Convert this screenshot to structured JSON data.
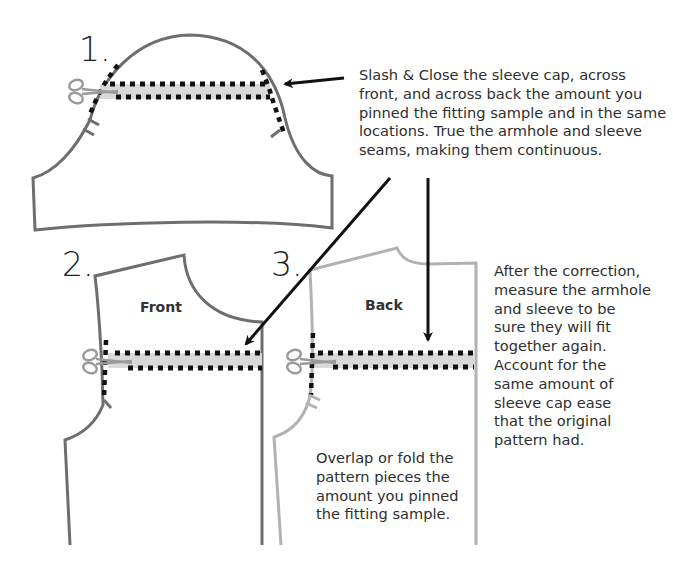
{
  "diagram": {
    "steps": [
      {
        "number": "1.",
        "piece": "sleeve"
      },
      {
        "number": "2.",
        "piece": "front bodice",
        "label": "Front"
      },
      {
        "number": "3.",
        "piece": "back bodice",
        "label": "Back"
      }
    ],
    "notes": {
      "slash_close": {
        "lines": [
          "Slash & Close the sleeve cap, across",
          "front, and across back the amount you",
          "pinned the fitting sample and in the same",
          "locations. True the armhole and sleeve",
          "seams, making them continuous."
        ]
      },
      "after_correction": {
        "lines": [
          "After the correction,",
          "measure the armhole",
          "and sleeve to be",
          "sure they will fit",
          "together again.",
          "Account for the",
          "same amount of",
          "sleeve cap ease",
          "that the original",
          "pattern had."
        ]
      },
      "overlap": {
        "lines": [
          "Overlap or fold the",
          "pattern pieces the",
          "amount you pinned",
          "the fitting sample."
        ]
      }
    },
    "icons": [
      "scissors-icon",
      "arrow-icon",
      "notch-mark-icon"
    ],
    "colors": {
      "front_outline": "#6e6e6e",
      "back_outline": "#b2b2b2",
      "fold_band": "#d9d9d9",
      "slash_dots": "#111111",
      "arrows": "#111111",
      "scissors": "#9a9a9a"
    }
  }
}
